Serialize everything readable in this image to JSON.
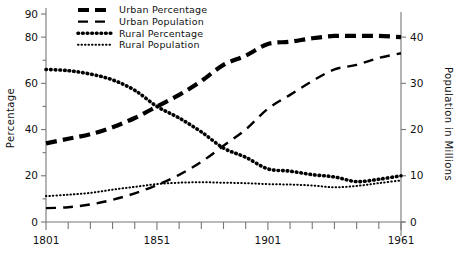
{
  "chart_data": {
    "type": "line",
    "title": "",
    "xlabel": "",
    "ylabel": "Percentage",
    "y2label": "Population in Millions",
    "xlim": [
      1801,
      1961
    ],
    "ylim": [
      0,
      90
    ],
    "y2lim": [
      0,
      45
    ],
    "grid": false,
    "legend_position": "top-center",
    "x_tick_labels": [
      "1801",
      "1851",
      "1901",
      "1961"
    ],
    "x_tick_values": [
      1801,
      1851,
      1901,
      1961
    ],
    "x_minor_ticks": [
      1811,
      1821,
      1831,
      1841,
      1861,
      1871,
      1881,
      1891,
      1911,
      1921,
      1931,
      1941,
      1951
    ],
    "y_tick_labels": [
      "0",
      "20",
      "40",
      "60",
      "80",
      "90"
    ],
    "y_tick_values": [
      0,
      20,
      40,
      60,
      80,
      90
    ],
    "y_minor_ticks": [
      10,
      30,
      50,
      70
    ],
    "y2_tick_labels": [
      "0",
      "10",
      "20",
      "30",
      "40"
    ],
    "y2_tick_values": [
      0,
      10,
      20,
      30,
      40
    ],
    "x": [
      1801,
      1811,
      1821,
      1831,
      1841,
      1851,
      1861,
      1871,
      1881,
      1891,
      1901,
      1911,
      1921,
      1931,
      1941,
      1951,
      1961
    ],
    "series": [
      {
        "name": "Urban Percentage",
        "axis": "left",
        "style": "thick-dashed",
        "color": "#000000",
        "values": [
          34,
          36,
          38,
          41,
          45,
          50,
          55,
          61,
          68,
          72,
          77,
          78,
          79.5,
          80.5,
          80.5,
          80.5,
          80
        ]
      },
      {
        "name": "Urban Population",
        "axis": "right",
        "style": "thin-dashed",
        "color": "#000000",
        "values": [
          3.0,
          3.2,
          3.8,
          4.8,
          6.2,
          8.0,
          10.2,
          13.0,
          16.5,
          20.0,
          24.5,
          27.5,
          30.5,
          33.0,
          34.0,
          35.5,
          36.5
        ]
      },
      {
        "name": "Rural Percentage",
        "axis": "left",
        "style": "thick-dotted",
        "color": "#000000",
        "values": [
          66,
          65.5,
          64,
          61.5,
          57,
          50,
          45,
          39,
          32,
          28,
          23,
          22,
          20.5,
          19.5,
          17.5,
          18.5,
          20
        ]
      },
      {
        "name": "Rural Population",
        "axis": "right",
        "style": "fine-dotted",
        "color": "#000000",
        "values": [
          5.6,
          5.9,
          6.3,
          7.0,
          7.6,
          8.2,
          8.5,
          8.6,
          8.5,
          8.4,
          8.2,
          8.1,
          7.9,
          7.5,
          7.8,
          8.4,
          9.0
        ]
      }
    ],
    "legend": [
      {
        "label": "Urban Percentage",
        "style": "thick-dashed"
      },
      {
        "label": "Urban Population",
        "style": "thin-dashed"
      },
      {
        "label": "Rural Percentage",
        "style": "thick-dotted"
      },
      {
        "label": "Rural Population",
        "style": "fine-dotted"
      }
    ]
  }
}
